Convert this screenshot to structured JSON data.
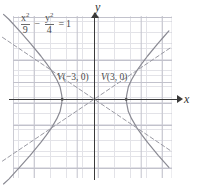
{
  "figure": {
    "type": "hyperbola-graph",
    "equation": {
      "term1_num_base": "x",
      "term1_num_exp": "2",
      "term1_den": "9",
      "operator": "−",
      "term2_num_base": "y",
      "term2_num_exp": "2",
      "term2_den": "4",
      "equals": "=",
      "rhs": "1",
      "plain": "x²/9 − y²/4 = 1"
    },
    "axes": {
      "x_label": "x",
      "y_label": "y"
    },
    "annotations": [
      {
        "name": "vertex-left",
        "vertex_symbol": "V",
        "coords": "(−3, 0)"
      },
      {
        "name": "vertex-right",
        "vertex_symbol": "V",
        "coords": "(3, 0)"
      }
    ],
    "colors": {
      "curve": "#8a8a93",
      "asymptote": "#9a9aa3",
      "axis": "#3a3a3a",
      "grid_major": "#c2c2cc",
      "grid_minor": "#e3e3e8",
      "background": "#ffffff"
    }
  },
  "chart_data": {
    "type": "line",
    "title": "",
    "subtitle": "",
    "xlabel": "x",
    "ylabel": "y",
    "xlim": [
      -8.8,
      7.3
    ],
    "ylim": [
      -9.2,
      7.8
    ],
    "grid": true,
    "grid_major_step": 2,
    "grid_minor_step": 0.5,
    "legend": "none",
    "curve_equation": "x^2/9 - y^2/4 = 1",
    "a": 3,
    "b": 2,
    "vertices": [
      [
        -3,
        0
      ],
      [
        3,
        0
      ]
    ],
    "asymptote_slopes": [
      0.6667,
      -0.6667
    ],
    "annotations": [
      {
        "text": "V(−3, 0)",
        "x": -3,
        "y": 0
      },
      {
        "text": "V(3, 0)",
        "x": 3,
        "y": 0
      }
    ],
    "series": [
      {
        "name": "left-branch",
        "points": [
          [
            -8.5,
            -7.85
          ],
          [
            -8,
            -7.4
          ],
          [
            -7,
            -6.32
          ],
          [
            -6,
            -5.2
          ],
          [
            -5,
            -4.0
          ],
          [
            -4.5,
            -3.35
          ],
          [
            -4,
            -2.65
          ],
          [
            -3.5,
            -1.8
          ],
          [
            -3.2,
            -1.15
          ],
          [
            -3.05,
            -0.4
          ],
          [
            -3,
            0
          ],
          [
            -3.05,
            0.4
          ],
          [
            -3.2,
            1.15
          ],
          [
            -3.5,
            1.8
          ],
          [
            -4,
            2.65
          ],
          [
            -4.5,
            3.35
          ],
          [
            -5,
            4.0
          ],
          [
            -6,
            5.2
          ],
          [
            -7,
            6.32
          ],
          [
            -8,
            7.4
          ],
          [
            -8.5,
            7.85
          ]
        ]
      },
      {
        "name": "right-branch",
        "points": [
          [
            7.0,
            6.32
          ],
          [
            6.5,
            5.76
          ],
          [
            6,
            5.2
          ],
          [
            5,
            4.0
          ],
          [
            4.5,
            3.35
          ],
          [
            4,
            2.65
          ],
          [
            3.5,
            1.8
          ],
          [
            3.2,
            1.15
          ],
          [
            3.05,
            0.4
          ],
          [
            3,
            0
          ],
          [
            3.05,
            -0.4
          ],
          [
            3.2,
            -1.15
          ],
          [
            3.5,
            -1.8
          ],
          [
            4,
            -2.65
          ],
          [
            4.5,
            -3.35
          ],
          [
            5,
            -4.0
          ],
          [
            6,
            -5.2
          ],
          [
            6.5,
            -5.76
          ],
          [
            7.0,
            -6.32
          ]
        ]
      },
      {
        "name": "asymptote-positive",
        "dashed": true,
        "points": [
          [
            -8.6,
            -5.73
          ],
          [
            7.1,
            4.73
          ]
        ]
      },
      {
        "name": "asymptote-negative",
        "dashed": true,
        "points": [
          [
            -8.6,
            5.73
          ],
          [
            7.1,
            -4.73
          ]
        ]
      }
    ]
  }
}
